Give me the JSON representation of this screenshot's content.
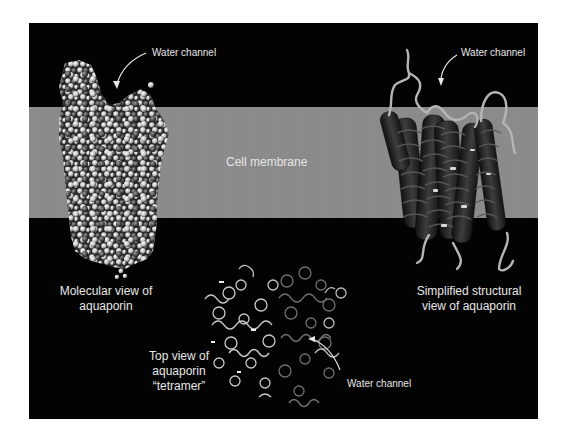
{
  "figure": {
    "background": "#030303",
    "membrane_color": "#8a8a8a",
    "label_color": "#e6e6e6",
    "membrane_label": "Cell membrane",
    "molecular_view": {
      "caption_line1": "Molecular view of",
      "caption_line2": "aquaporin",
      "channel_label": "Water channel"
    },
    "structural_view": {
      "caption_line1": "Simplified structural",
      "caption_line2": "view of aquaporin",
      "channel_label": "Water channel"
    },
    "top_view": {
      "caption_line1": "Top view of",
      "caption_line2": "aquaporin",
      "caption_line3": "“tetramer”",
      "channel_label": "Water channel"
    }
  }
}
